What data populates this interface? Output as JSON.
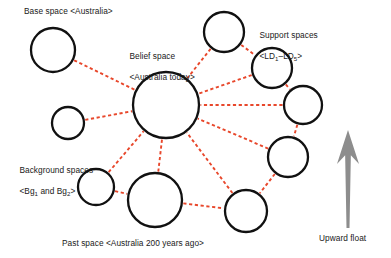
{
  "figure": {
    "type": "mental-spaces-network-diagram",
    "width": 391,
    "height": 258,
    "background_color": "#ffffff",
    "circle_stroke_color": "#111111",
    "connector_color": "#e8472b",
    "connector_style": "dashed",
    "arrow_color": "#8d8d8d"
  },
  "labels": {
    "base_space": "Base space <Australia>",
    "belief_space_line1": "Belief space",
    "belief_space_line2": "<Australia today>",
    "support_spaces_line1": "Support spaces",
    "support_spaces_line2_prefix": "<LD",
    "support_spaces_line2_sub1": "1",
    "support_spaces_line2_mid": "–LD",
    "support_spaces_line2_sub2": "5",
    "support_spaces_line2_suffix": ">",
    "background_spaces_line1": "Background spaces",
    "background_spaces_line2_prefix": "<Bg",
    "background_spaces_line2_sub1": "1",
    "background_spaces_line2_mid": " and Bg",
    "background_spaces_line2_sub2": "2",
    "background_spaces_line2_suffix": ">",
    "past_space": "Past space <Australia 200 years ago>",
    "upward_float": "Upward float"
  },
  "nodes": [
    {
      "id": "base",
      "name": "base-space-circle",
      "cx": 53,
      "cy": 50,
      "r": 22
    },
    {
      "id": "belief",
      "name": "belief-space-circle",
      "cx": 166,
      "cy": 105,
      "r": 33
    },
    {
      "id": "bg1",
      "name": "background-space-1-circle",
      "cx": 68,
      "cy": 123,
      "r": 16
    },
    {
      "id": "bg2",
      "name": "background-space-2-circle",
      "cx": 96,
      "cy": 187,
      "r": 18
    },
    {
      "id": "past",
      "name": "past-space-circle",
      "cx": 155,
      "cy": 200,
      "r": 27
    },
    {
      "id": "ld1",
      "name": "support-space-1-circle",
      "cx": 224,
      "cy": 32,
      "r": 20
    },
    {
      "id": "ld2",
      "name": "support-space-2-circle",
      "cx": 272,
      "cy": 68,
      "r": 20
    },
    {
      "id": "ld3",
      "name": "support-space-3-circle",
      "cx": 303,
      "cy": 105,
      "r": 19
    },
    {
      "id": "ld4",
      "name": "support-space-4-circle",
      "cx": 288,
      "cy": 157,
      "r": 20
    },
    {
      "id": "ld5",
      "name": "support-space-5-circle",
      "cx": 246,
      "cy": 211,
      "r": 21
    }
  ],
  "edges": [
    {
      "from": "base",
      "to": "belief"
    },
    {
      "from": "bg1",
      "to": "belief"
    },
    {
      "from": "bg2",
      "to": "belief"
    },
    {
      "from": "past",
      "to": "belief"
    },
    {
      "from": "ld1",
      "to": "belief"
    },
    {
      "from": "ld2",
      "to": "belief"
    },
    {
      "from": "ld3",
      "to": "belief"
    },
    {
      "from": "ld4",
      "to": "belief"
    },
    {
      "from": "ld5",
      "to": "belief"
    },
    {
      "from": "ld1",
      "to": "ld2"
    },
    {
      "from": "ld2",
      "to": "ld3"
    },
    {
      "from": "ld3",
      "to": "ld4"
    },
    {
      "from": "ld4",
      "to": "ld5"
    },
    {
      "from": "past",
      "to": "ld5"
    },
    {
      "from": "bg2",
      "to": "past"
    }
  ],
  "arrow": {
    "name": "upward-float-arrow",
    "x": 348,
    "tail_y": 228,
    "head_y": 130,
    "shaft_width": 3,
    "head_width": 22,
    "head_height": 34
  }
}
